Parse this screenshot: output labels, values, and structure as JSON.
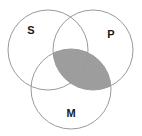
{
  "figure": {
    "kind": "venn-diagram",
    "background_color": "#ffffff",
    "stroke_color": "#9a9a9a",
    "stroke_width": 1,
    "shaded_fill_color": "#9d9d9d",
    "shaded_region": "P-and-M-intersection"
  },
  "circles": [
    {
      "id": "S",
      "label": "S",
      "cx": 48,
      "cy": 50,
      "r": 40,
      "label_x": 31,
      "label_y": 31
    },
    {
      "id": "P",
      "label": "P",
      "cx": 93,
      "cy": 50,
      "r": 40,
      "label_x": 111,
      "label_y": 35
    },
    {
      "id": "M",
      "label": "M",
      "cx": 71,
      "cy": 89,
      "r": 40,
      "label_x": 71,
      "label_y": 114
    }
  ],
  "labels": {
    "s": "S",
    "p": "P",
    "m": "M"
  }
}
